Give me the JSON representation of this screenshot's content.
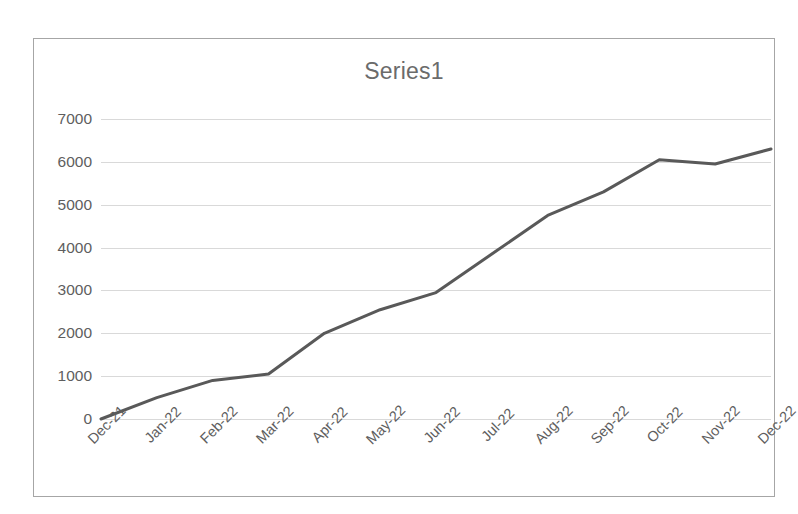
{
  "chart_data": {
    "type": "line",
    "title": "Series1",
    "xlabel": "",
    "ylabel": "",
    "categories": [
      "Dec-21",
      "Jan-22",
      "Feb-22",
      "Mar-22",
      "Apr-22",
      "May-22",
      "Jun-22",
      "Jul-22",
      "Aug-22",
      "Sep-22",
      "Oct-22",
      "Nov-22",
      "Dec-22"
    ],
    "series": [
      {
        "name": "Series1",
        "values": [
          0,
          500,
          900,
          1050,
          2000,
          2550,
          2950,
          3850,
          4750,
          5300,
          6050,
          5950,
          6300
        ]
      }
    ],
    "ylim": [
      0,
      7000
    ],
    "ytick_labels": [
      "7000",
      "6000",
      "5000",
      "4000",
      "3000",
      "2000",
      "1000",
      "0"
    ],
    "ytick_values": [
      7000,
      6000,
      5000,
      4000,
      3000,
      2000,
      1000,
      0
    ],
    "grid": true,
    "legend": "none",
    "line_color": "#595959",
    "grid_color": "#d9d9d9",
    "text_color": "#5e5e5e",
    "border_color": "#a6a6a6",
    "background_color": "#ffffff",
    "markers": false,
    "line_width": 3
  }
}
